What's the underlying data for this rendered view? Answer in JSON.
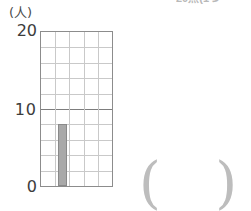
{
  "header": {
    "clipped_text": "20点(1つ"
  },
  "axis": {
    "unit_label": "(人)",
    "ticks": [
      {
        "label": "20",
        "value": 20
      },
      {
        "label": "10",
        "value": 10
      },
      {
        "label": "0",
        "value": 0
      }
    ]
  },
  "answer": {
    "open_paren": "(",
    "close_paren": ")",
    "value": ""
  },
  "colors": {
    "bar_fill": "#a9a9a9",
    "bar_stroke": "#8a8a8a",
    "grid_minor": "#c9c9c9",
    "grid_major": "#7d7d7d",
    "plot_border": "#8c8c8c",
    "text": "#3c3c3c"
  },
  "chart_data": {
    "type": "bar",
    "title": "",
    "subtitle": "",
    "xlabel": "",
    "ylabel": "(人)",
    "ylim": [
      0,
      20
    ],
    "ytick_values": [
      0,
      10,
      20
    ],
    "ytick_labels": [
      "0",
      "10",
      "20"
    ],
    "y_minor_step": 2,
    "grid": true,
    "legend": "none",
    "columns": 5,
    "rows": 10,
    "categories": [
      "1",
      "2",
      "3",
      "4",
      "5"
    ],
    "values": [
      0,
      8,
      0,
      0,
      0
    ],
    "bars": [
      {
        "category": "2",
        "column_index": 1,
        "value": 8
      }
    ],
    "annotations": []
  }
}
